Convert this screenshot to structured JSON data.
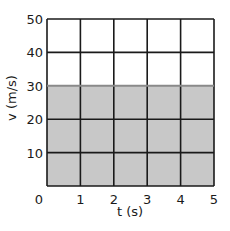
{
  "chart_data": {
    "type": "area",
    "title": "",
    "xlabel": "t (s)",
    "ylabel": "v (m/s)",
    "xlim": [
      0,
      5
    ],
    "ylim": [
      0,
      50
    ],
    "x_ticks": [
      0,
      1,
      2,
      3,
      4,
      5
    ],
    "y_ticks": [
      0,
      10,
      20,
      30,
      40,
      50
    ],
    "grid": true,
    "legend": null,
    "series": [
      {
        "name": "velocity",
        "x": [
          0,
          1,
          2,
          3,
          4,
          5
        ],
        "values": [
          30,
          30,
          30,
          30,
          30,
          30
        ],
        "fill_color": "#c8c8c8",
        "line_color": "#8a8a8a"
      }
    ]
  },
  "colors": {
    "grid": "#1a1a1a",
    "fill": "#c8c8c8",
    "line": "#8a8a8a",
    "background": "#ffffff"
  }
}
